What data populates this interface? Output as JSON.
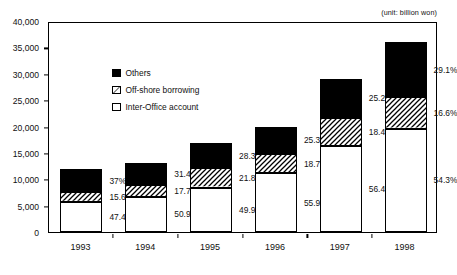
{
  "unit_note": "(unit: billion won)",
  "legend": {
    "position": "inside-top-left",
    "items": [
      {
        "label": "Others",
        "key": "others",
        "swatch": "solid-black-square-icon"
      },
      {
        "label": "Off-shore borrowing",
        "key": "offshore",
        "swatch": "hatched-square-icon"
      },
      {
        "label": "Inter-Office account",
        "key": "inter_office",
        "swatch": "white-square-icon"
      }
    ]
  },
  "chart_data": {
    "type": "bar",
    "stacked": true,
    "title": "",
    "subtitle": "",
    "xlabel": "",
    "ylabel": "",
    "unit": "billion won",
    "ylim": [
      0,
      40000
    ],
    "ytick_labels": [
      "0",
      "5,000",
      "10,000",
      "15,000",
      "20,000",
      "25,000",
      "30,000",
      "35,000",
      "40,000"
    ],
    "ytick_values": [
      0,
      5000,
      10000,
      15000,
      20000,
      25000,
      30000,
      35000,
      40000
    ],
    "grid": false,
    "categories": [
      "1993",
      "1994",
      "1995",
      "1996",
      "1997",
      "1998"
    ],
    "totals": [
      11900,
      13100,
      16800,
      19900,
      29000,
      36000
    ],
    "series": [
      {
        "name": "Inter-Office account",
        "key": "inter_office",
        "fill": "white",
        "values": [
          5640,
          6670,
          8383,
          11124,
          16356,
          19548
        ],
        "percent_labels": [
          "47.4%",
          "50.9%",
          "49.9%",
          "55.9%",
          "56.4%",
          "54.3%"
        ]
      },
      {
        "name": "Off-shore borrowing",
        "key": "offshore",
        "fill": "hatched",
        "values": [
          1856,
          2319,
          3662,
          3721,
          5336,
          5976
        ],
        "percent_labels": [
          "15.6%",
          "17.7%",
          "21.8%",
          "18.7%",
          "18.4%",
          "16.6%"
        ]
      },
      {
        "name": "Others",
        "key": "others",
        "fill": "black",
        "values": [
          4403,
          4113,
          4754,
          5035,
          7308,
          10476
        ],
        "percent_labels": [
          "37%",
          "31.4%",
          "28.3%",
          "25.3%",
          "25.2%",
          "29.1%"
        ]
      }
    ]
  }
}
